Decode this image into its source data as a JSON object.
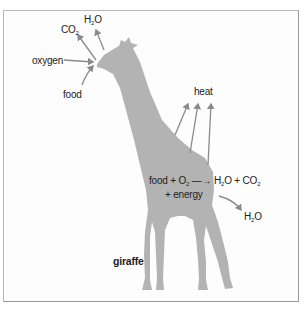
{
  "diagram": {
    "subject": "giraffe",
    "colors": {
      "body": "#b3b3b3",
      "arrow": "#8a8a8a",
      "text": "#222222",
      "frame": "#b8b8b8"
    },
    "head_labels": {
      "co2": {
        "main": "CO",
        "sub": "2"
      },
      "h2o": {
        "main": "H",
        "sub": "2",
        "tail": "O"
      },
      "oxygen": "oxygen",
      "food": "food"
    },
    "heat_label": "heat",
    "equation": {
      "part1": "food + O",
      "sub1": "2",
      "arrow": "—→",
      "part2": "H",
      "sub2": "2",
      "part3": "O + CO",
      "sub3": "2",
      "line2": "+ energy"
    },
    "output_h2o": {
      "main": "H",
      "sub": "2",
      "tail": "O"
    },
    "name_label": "giraffe"
  }
}
